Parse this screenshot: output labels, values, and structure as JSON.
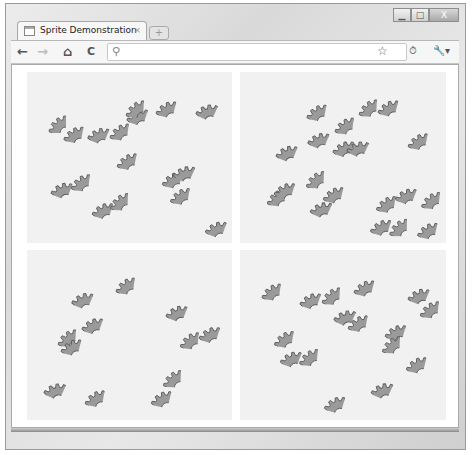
{
  "window": {
    "controls": {
      "minimize": "▁",
      "maximize": "□",
      "close": "X"
    }
  },
  "tab": {
    "title": "Sprite Demonstration",
    "close": "×",
    "new_tab": "+"
  },
  "toolbar": {
    "back": "←",
    "forward": "→",
    "home": "⌂",
    "reload": "C",
    "search_icon": "⚲",
    "address_value": "",
    "star": "☆",
    "extension": "⏱",
    "wrench": "🔧▾"
  },
  "colors": {
    "gear_fill": "#9a9a9a",
    "gear_stroke": "#5c5c5c",
    "panel_bg": "#f1f1f1"
  },
  "panels": [
    {
      "name": "top-left",
      "x": 27,
      "y": 72,
      "w": 205,
      "h": 171,
      "gears": [
        [
          48,
          115
        ],
        [
          66,
          123
        ],
        [
          93,
          122
        ],
        [
          111,
          121
        ],
        [
          131,
          104
        ],
        [
          126,
          99
        ],
        [
          159,
          97
        ],
        [
          202,
          98
        ],
        [
          119,
          150
        ],
        [
          56,
          177
        ],
        [
          72,
          172
        ],
        [
          96,
          198
        ],
        [
          110,
          192
        ],
        [
          165,
          168
        ],
        [
          179,
          160
        ],
        [
          172,
          185
        ],
        [
          210,
          216
        ]
      ]
    },
    {
      "name": "top-right",
      "x": 240,
      "y": 72,
      "w": 206,
      "h": 171,
      "gears": [
        [
          309,
          101
        ],
        [
          313,
          127
        ],
        [
          336,
          115
        ],
        [
          337,
          136
        ],
        [
          359,
          98
        ],
        [
          381,
          96
        ],
        [
          353,
          135
        ],
        [
          410,
          130
        ],
        [
          281,
          140
        ],
        [
          268,
          187
        ],
        [
          278,
          178
        ],
        [
          306,
          170
        ],
        [
          326,
          183
        ],
        [
          316,
          196
        ],
        [
          378,
          193
        ],
        [
          400,
          183
        ],
        [
          422,
          190
        ],
        [
          374,
          215
        ],
        [
          389,
          218
        ],
        [
          420,
          219
        ]
      ]
    },
    {
      "name": "bottom-left",
      "x": 27,
      "y": 250,
      "w": 205,
      "h": 170,
      "gears": [
        [
          77,
          287
        ],
        [
          117,
          275
        ],
        [
          86,
          313
        ],
        [
          58,
          328
        ],
        [
          64,
          335
        ],
        [
          50,
          377
        ],
        [
          87,
          387
        ],
        [
          171,
          300
        ],
        [
          181,
          330
        ],
        [
          203,
          322
        ],
        [
          163,
          369
        ],
        [
          154,
          387
        ]
      ]
    },
    {
      "name": "bottom-right",
      "x": 240,
      "y": 250,
      "w": 206,
      "h": 170,
      "gears": [
        [
          263,
          281
        ],
        [
          304,
          288
        ],
        [
          322,
          286
        ],
        [
          357,
          276
        ],
        [
          340,
          304
        ],
        [
          350,
          312
        ],
        [
          413,
          283
        ],
        [
          421,
          299
        ],
        [
          389,
          320
        ],
        [
          382,
          335
        ],
        [
          409,
          353
        ],
        [
          377,
          377
        ],
        [
          276,
          328
        ],
        [
          285,
          346
        ],
        [
          300,
          347
        ],
        [
          328,
          392
        ]
      ]
    }
  ]
}
